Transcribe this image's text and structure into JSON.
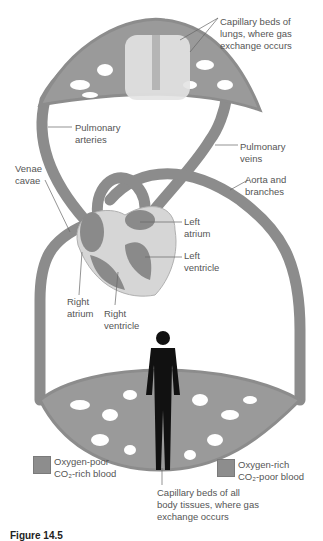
{
  "diagram": {
    "labels": {
      "lung_capillaries": "Capillary beds of\nlungs, where gas\nexchange occurs",
      "pulmonary_arteries": "Pulmonary\narteries",
      "pulmonary_veins": "Pulmonary\nveins",
      "venae_cavae": "Venae\ncavae",
      "aorta": "Aorta and\nbranches",
      "left_atrium": "Left\natrium",
      "left_ventricle": "Left\nventricle",
      "right_atrium": "Right\natrium",
      "right_ventricle": "Right\nventricle",
      "body_capillaries": "Capillary beds of all\nbody tissues, where gas\nexchange occurs"
    },
    "legend": [
      {
        "label": "Oxygen-poor\nCO₂-rich blood",
        "color": "#8d8d8d"
      },
      {
        "label": "Oxygen-rich\nCO₂-poor blood",
        "color": "#8d8d8d"
      }
    ],
    "caption": "Figure 14.5"
  }
}
